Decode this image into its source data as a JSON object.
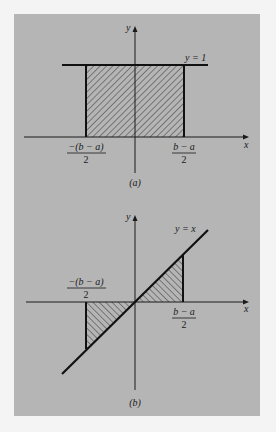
{
  "figure": {
    "background_color": "#f4f4f4",
    "panel_color": "#b5b5b5",
    "ink_color": "#1a1a1a",
    "panels": [
      {
        "id": "a",
        "caption": "(a)",
        "y_axis_label": "y",
        "x_axis_label": "x",
        "curve_label": "y = 1",
        "left_bound_numerator": "−(b − a)",
        "left_bound_denominator": "2",
        "right_bound_numerator": "b − a",
        "right_bound_denominator": "2",
        "shaded_region": "rectangle under y = 1 between −(b − a)/2 and (b − a)/2"
      },
      {
        "id": "b",
        "caption": "(b)",
        "y_axis_label": "y",
        "x_axis_label": "x",
        "curve_label": "y = x",
        "left_bound_numerator": "−(b − a)",
        "left_bound_denominator": "2",
        "right_bound_numerator": "b − a",
        "right_bound_denominator": "2",
        "shaded_region": "two triangles between y = x and x-axis from −(b − a)/2 to (b − a)/2"
      }
    ]
  }
}
